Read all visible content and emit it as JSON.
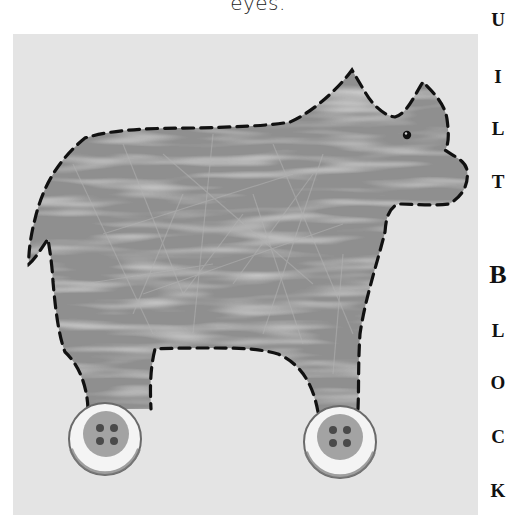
{
  "caption": {
    "text": "eyes."
  },
  "side_title": {
    "letters": [
      {
        "char": "U",
        "y": 10
      },
      {
        "char": "I",
        "y": 67
      },
      {
        "char": "L",
        "y": 119
      },
      {
        "char": "T",
        "y": 172
      },
      {
        "char": "B",
        "y": 262,
        "big": true
      },
      {
        "char": "L",
        "y": 321
      },
      {
        "char": "O",
        "y": 373
      },
      {
        "char": "C",
        "y": 427
      },
      {
        "char": "K",
        "y": 481
      }
    ]
  },
  "illustration": {
    "subject": "fabric rhinoceros on wheels quilt block",
    "colors": {
      "background": "#e4e4e4",
      "background_mottle": "#cfcfcf",
      "body": "#8f8f8f",
      "body_fibers": "#b0b0b0",
      "stitch": "#111111",
      "button_outer": "#f2f2f2",
      "button_rim": "#6a6a6a",
      "button_inner": "#9d9d9d",
      "button_holes": "#4a4a4a",
      "eye": "#111111"
    },
    "buttons": [
      {
        "name": "left-wheel-button",
        "cx": 92,
        "cy": 405,
        "r": 36
      },
      {
        "name": "right-wheel-button",
        "cx": 327,
        "cy": 408,
        "r": 36
      }
    ],
    "eye": {
      "cx": 394,
      "cy": 101,
      "r": 4
    }
  }
}
